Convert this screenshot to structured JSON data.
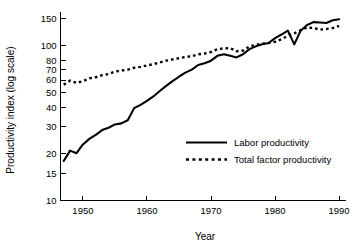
{
  "chart_data": {
    "type": "line",
    "title": "",
    "xlabel": "Year",
    "ylabel": "Productivity index (log scale)",
    "y_scale": "log",
    "ylim": [
      10,
      165
    ],
    "xlim": [
      1946.5,
      1991
    ],
    "grid": false,
    "legend_position": "center-right-inside",
    "y_ticks": [
      10,
      15,
      20,
      30,
      40,
      50,
      60,
      70,
      80,
      100,
      150
    ],
    "y_tick_labels": [
      "10",
      "15",
      "20",
      "30",
      "40",
      "50",
      "60",
      "70",
      "80",
      "100",
      "150"
    ],
    "x_ticks": [
      1950,
      1960,
      1970,
      1980,
      1990
    ],
    "x_tick_labels": [
      "1950",
      "1960",
      "1970",
      "1980",
      "1990"
    ],
    "x": [
      1947,
      1948,
      1949,
      1950,
      1951,
      1952,
      1953,
      1954,
      1955,
      1956,
      1957,
      1958,
      1959,
      1960,
      1961,
      1962,
      1963,
      1964,
      1965,
      1966,
      1967,
      1968,
      1969,
      1970,
      1971,
      1972,
      1973,
      1974,
      1975,
      1976,
      1977,
      1978,
      1979,
      1980,
      1981,
      1982,
      1983,
      1984,
      1985,
      1986,
      1987,
      1988,
      1989,
      1990
    ],
    "series": [
      {
        "name": "Labor productivity",
        "style": "solid",
        "color": "#000000",
        "values": [
          18.0,
          21.0,
          20.2,
          23.0,
          25.0,
          26.5,
          28.5,
          29.5,
          31.0,
          31.5,
          33.0,
          39.5,
          41.5,
          44.0,
          47.0,
          51.0,
          55.0,
          59.0,
          63.0,
          67.0,
          70.0,
          75.0,
          77.0,
          80.0,
          86.0,
          88.0,
          86.0,
          84.0,
          88.0,
          95.0,
          99.0,
          102.0,
          104.0,
          112.0,
          118.0,
          125.0,
          102.0,
          125.0,
          136.0,
          142.0,
          141.0,
          140.0,
          146.0,
          148.0
        ]
      },
      {
        "name": "Total factor productivity",
        "style": "dotted",
        "color": "#000000",
        "values": [
          56.0,
          59.5,
          57.5,
          59.0,
          61.5,
          62.5,
          64.5,
          65.5,
          68.0,
          69.0,
          70.0,
          72.0,
          73.0,
          74.5,
          76.0,
          78.0,
          80.0,
          81.5,
          83.0,
          84.5,
          85.5,
          88.0,
          89.0,
          91.0,
          95.0,
          96.0,
          96.5,
          92.0,
          93.0,
          99.0,
          101.0,
          103.0,
          104.0,
          106.0,
          110.0,
          116.0,
          120.0,
          126.0,
          131.0,
          130.0,
          127.0,
          128.0,
          130.0,
          134.0
        ]
      }
    ],
    "legend": [
      {
        "label": "Labor productivity",
        "style": "solid"
      },
      {
        "label": "Total factor productivity",
        "style": "dotted"
      }
    ]
  }
}
